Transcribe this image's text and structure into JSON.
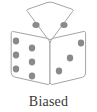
{
  "figure": {
    "caption": "Biased",
    "object_name": "die",
    "projection": "isometric",
    "background_color": "#ffffff",
    "outline_color": "#9a9a9a",
    "face_fill_color": "#ffffff",
    "pip_color": "#8a8a8a",
    "caption_color": "#3a3a3a"
  },
  "die": {
    "faces": [
      {
        "name": "top-face",
        "value": 2,
        "outline": "25,11 50,2 75,11 50,40",
        "pips": [
          {
            "cx": 36,
            "cy": 25,
            "rx": 3.6,
            "ry": 3.0
          },
          {
            "cx": 64,
            "cy": 25,
            "rx": 3.6,
            "ry": 3.0
          }
        ]
      },
      {
        "name": "left-face",
        "value": 6,
        "outline": "13,30 50,40 50,85 13,77",
        "pips": [
          {
            "cx": 16,
            "cy": 41,
            "rx": 3.2,
            "ry": 3.4
          },
          {
            "cx": 16,
            "cy": 55,
            "rx": 3.2,
            "ry": 3.4
          },
          {
            "cx": 16,
            "cy": 69,
            "rx": 3.2,
            "ry": 3.4
          },
          {
            "cx": 32,
            "cy": 48,
            "rx": 3.2,
            "ry": 3.4
          },
          {
            "cx": 32,
            "cy": 62,
            "rx": 3.2,
            "ry": 3.4
          },
          {
            "cx": 32,
            "cy": 76,
            "rx": 3.2,
            "ry": 3.4
          }
        ]
      },
      {
        "name": "right-face",
        "value": 3,
        "outline": "50,40 87,30 87,77 50,85",
        "pips": [
          {
            "cx": 81,
            "cy": 43,
            "rx": 3.2,
            "ry": 3.4
          },
          {
            "cx": 70,
            "cy": 58,
            "rx": 3.2,
            "ry": 3.4
          },
          {
            "cx": 59,
            "cy": 71,
            "rx": 3.2,
            "ry": 3.4
          }
        ]
      }
    ]
  }
}
